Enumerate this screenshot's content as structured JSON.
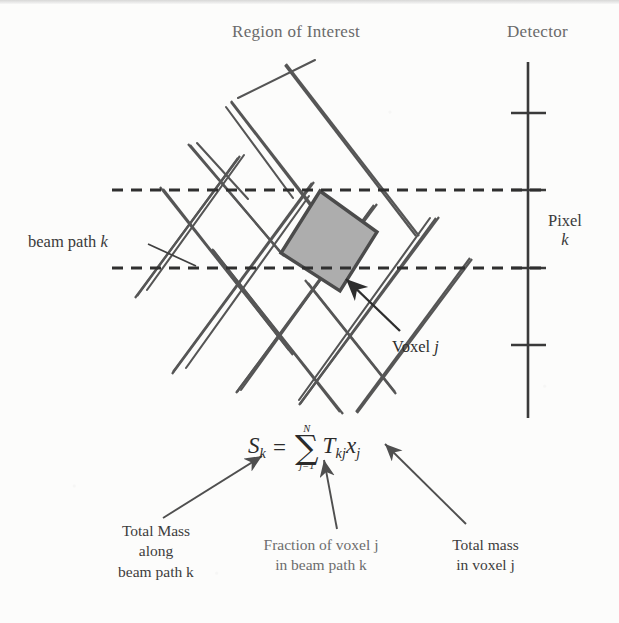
{
  "figure": {
    "title_roi": "Region of Interest",
    "title_detector": "Detector",
    "label_beam_path": "beam path",
    "label_beam_path_index": "k",
    "label_pixel": "Pixel",
    "label_pixel_index": "k",
    "label_voxel": "Voxel",
    "label_voxel_index": "j",
    "colors": {
      "voxel_fill": "#adadad",
      "voxel_stroke": "#4b4b4b",
      "grid_stroke": "#555555",
      "detector_stroke": "#3a3a3a",
      "beam_dash_stroke": "#2f2f2f",
      "text_primary": "#2e2e2e",
      "text_muted": "#6a6a6a"
    }
  },
  "equation": {
    "lhs_symbol": "S",
    "lhs_subscript": "k",
    "equals": "=",
    "sum_symbol": "∑",
    "sum_upper_limit": "N",
    "sum_lower_limit": "j=1",
    "term1_symbol": "T",
    "term1_subscript": "kj",
    "term2_symbol": "x",
    "term2_subscript": "j",
    "plain_text": "S_k = sum_{j=1}^{N} T_kj x_j"
  },
  "annotations": [
    {
      "id": "total-mass-along-beam-path",
      "lines": [
        "Total Mass",
        "along",
        "beam path k"
      ],
      "points_to": "S_k"
    },
    {
      "id": "fraction-of-voxel-in-beam-path",
      "lines": [
        "Fraction of voxel j",
        "in beam path k"
      ],
      "points_to": "T_kj"
    },
    {
      "id": "total-mass-in-voxel",
      "lines": [
        "Total mass",
        "in voxel j"
      ],
      "points_to": "x_j"
    }
  ],
  "geometry": {
    "detector_line": {
      "x": 528,
      "y1": 62,
      "y2": 418
    },
    "detector_ticks_y": [
      113,
      190,
      268,
      345
    ],
    "beam_dashed_lines": [
      {
        "y": 190,
        "x1": 112,
        "x2": 545
      },
      {
        "y": 268,
        "x1": 112,
        "x2": 545
      }
    ],
    "voxel_polygon": [
      [
        320,
        191
      ],
      [
        377,
        232
      ],
      [
        340,
        291
      ],
      [
        281,
        253
      ]
    ],
    "grid_rotation_deg": 35
  }
}
